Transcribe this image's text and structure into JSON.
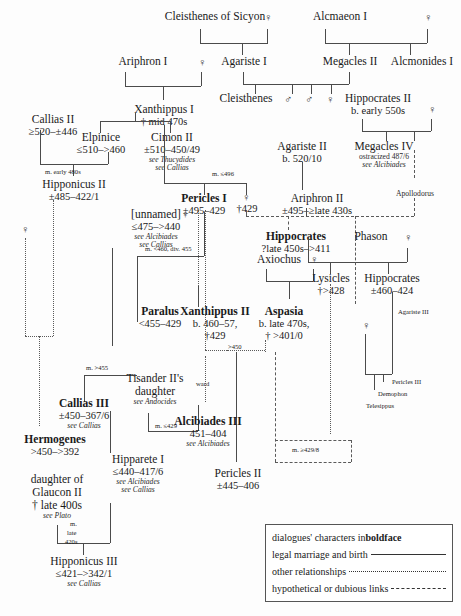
{
  "symbols": {
    "female": "♀",
    "male": "♂",
    "dagger": "†"
  },
  "people": {
    "cleisthenes_sicyon": {
      "name": "Cleisthenes of Sicyon"
    },
    "alcmaeon_i": {
      "name": "Alcmaeon I"
    },
    "ariphron_i": {
      "name": "Ariphron I"
    },
    "agariste_i": {
      "name": "Agariste I"
    },
    "megacles_ii": {
      "name": "Megacles II"
    },
    "alcmonides_i": {
      "name": "Alcmonides I"
    },
    "cleisthenes": {
      "name": "Cleisthenes"
    },
    "hippocrates_ii": {
      "name": "Hippocrates II",
      "dates": "b. early 550s"
    },
    "xanthippus_i": {
      "name": "Xanthippus I",
      "dates": "† mid 470s"
    },
    "callias_ii": {
      "name": "Callias II",
      "dates": "≥520–±446"
    },
    "elpinice": {
      "name": "Elpinice",
      "dates": "≤510–>460"
    },
    "cimon_ii": {
      "name": "Cimon II",
      "dates": "±510–450/49",
      "see1": "see Thucydides",
      "see2": "see Callias"
    },
    "agariste_ii": {
      "name": "Agariste II",
      "dates": "b. 520/10"
    },
    "megacles_iv": {
      "name": "Megacles IV",
      "note": "ostracized 487/6",
      "see1": "see Alcibiades"
    },
    "hipponicus_ii": {
      "name": "Hipponicus II",
      "dates": "±485–422/1"
    },
    "unnamed": {
      "name": "[unnamed]",
      "dates": "≤475–>440",
      "see1": "see Alcibiades",
      "see2": "see Callias"
    },
    "pericles_i": {
      "name": "Pericles I",
      "dates": "±495–429"
    },
    "ariphron_ii": {
      "name": "Ariphron II",
      "dates": "±495–≥late 430s"
    },
    "pericles_wife": {
      "dates": "†429"
    },
    "apollodorus": {
      "name": "Apollodorus"
    },
    "hippocrates_brother": {
      "name": "Hippocrates",
      "dates": "?late 450s–>411"
    },
    "phason": {
      "name": "Phason"
    },
    "axiochus": {
      "name": "Axiochus"
    },
    "lysicles": {
      "name": "Lysicles",
      "dates": "†>428"
    },
    "hippocrates_iii": {
      "name": "Hippocrates",
      "dates": "±460–424"
    },
    "agariste_iii": {
      "name": "Agariste III"
    },
    "paralus": {
      "name": "Paralus",
      "dates": "<455–429"
    },
    "xanthippus_ii": {
      "name": "Xanthippus II",
      "dates": "b. 460–57,",
      "dates2": "†429"
    },
    "aspasia": {
      "name": "Aspasia",
      "dates": "b. late 470s,",
      "dates2": "† >401/0"
    },
    "tisander_daughter": {
      "name": "Tisander II's",
      "name2": "daughter",
      "see1": "see Andocides"
    },
    "callias_iii": {
      "name": "Callias III",
      "dates": "±450–367/6",
      "see1": "see Callias"
    },
    "alcibiades_iii": {
      "name": "Alcibiades III",
      "dates": "451–404",
      "see1": "see Alcibiades"
    },
    "hermogenes": {
      "name": "Hermogenes",
      "dates": ">450–>392"
    },
    "hipparete_i": {
      "name": "Hipparete I",
      "dates": "≤440–417/6",
      "see1": "see Alcibiades",
      "see2": "see Callias"
    },
    "glaucon_daughter": {
      "name": "daughter of",
      "name2": "Glaucon II",
      "dates": "† late 400s",
      "see1": "see Plato"
    },
    "pericles_ii": {
      "name": "Pericles II",
      "dates": "±445–406"
    },
    "hipponicus_iii": {
      "name": "Hipponicus III",
      "dates": "≤421–>342/1",
      "see1": "see Callias"
    },
    "pericles_iii": {
      "name": "Pericles III"
    },
    "demophon": {
      "name": "Demophon"
    },
    "telesippus": {
      "name": "Telesippus"
    }
  },
  "marriage_notes": {
    "callias_hipponicus": "m. early 480s",
    "pericles_wife_m": "m. ≤496",
    "paralus_m": "m. <460, div. 455",
    "callias_iii_m": "m. >455",
    "tisander_m": "m. ≤429",
    "aspasia_pericles": ">450",
    "aspasia_lysicles": "m. ≥429/8",
    "ward": "ward",
    "hipponicus_iii_m1": "m.",
    "hipponicus_iii_m2": "late",
    "hipponicus_iii_m3": "420s"
  },
  "legend": {
    "rows": [
      {
        "pre": "dialogues' characters in ",
        "bold": "boldface",
        "line": "none"
      },
      {
        "pre": "legal marriage and birth",
        "bold": "",
        "line": "solid"
      },
      {
        "pre": "other relationships",
        "bold": "",
        "line": "dot"
      },
      {
        "pre": "hypothetical or dubious links",
        "bold": "",
        "line": "dash"
      }
    ]
  }
}
